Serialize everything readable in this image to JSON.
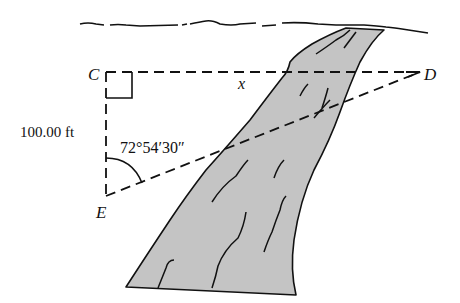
{
  "diagram": {
    "points": {
      "C": "C",
      "D": "D",
      "E": "E"
    },
    "side_label": "100.00 ft",
    "unknown_label": "x",
    "angle_label": "72°54′30″",
    "colors": {
      "ink": "#111111",
      "river_fill": "#c4c4c4",
      "background": "#ffffff"
    }
  }
}
